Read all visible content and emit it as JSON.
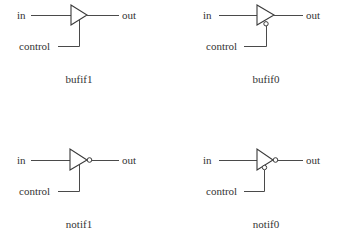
{
  "diagram": {
    "gates": [
      {
        "name": "bufif1",
        "input_label": "in",
        "output_label": "out",
        "control_label": "control",
        "output_inverted": false,
        "control_inverted": false
      },
      {
        "name": "bufif0",
        "input_label": "in",
        "output_label": "out",
        "control_label": "control",
        "output_inverted": false,
        "control_inverted": true
      },
      {
        "name": "notif1",
        "input_label": "in",
        "output_label": "out",
        "control_label": "control",
        "output_inverted": true,
        "control_inverted": false
      },
      {
        "name": "notif0",
        "input_label": "in",
        "output_label": "out",
        "control_label": "control",
        "output_inverted": true,
        "control_inverted": true
      }
    ]
  }
}
